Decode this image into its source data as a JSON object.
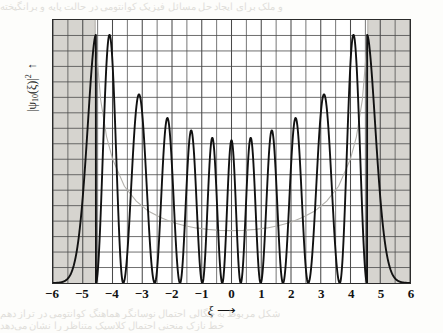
{
  "figure": {
    "name": "harmonic-oscillator-probability-density",
    "bleed_top": "و ملک برای ایجاد حل مسائل فیزیک کوانتومی در حالت پایه و برانگیخته",
    "bleed_bottom_1": "شکل مربوط به چگالی احتمال نوسانگر هماهنگ کوانتومی در تراز دهم",
    "bleed_bottom_2": "خط نازک منحنی احتمال کلاسیک متناظر را نشان می‌دهد"
  },
  "axes": {
    "xlabel": "ξ",
    "xlabel_arrow": "⟶",
    "ylabel_prefix": "|ψ",
    "ylabel_sub": "10",
    "ylabel_mid": "(ξ)|",
    "ylabel_sup": "2",
    "ylabel_arrow": "↑",
    "xticks": [
      "−6",
      "−5",
      "−4",
      "−3",
      "−2",
      "−1",
      "0",
      "1",
      "2",
      "3",
      "4",
      "5",
      "6"
    ]
  },
  "style": {
    "frame_color": "#2b2b2b",
    "grid_color": "#4a4a4a",
    "shade_color": "#d6d4cf",
    "curve_color": "#111111",
    "classical_color": "#b3b1ac",
    "paper_color": "#fdfdfb"
  },
  "chart_data": {
    "type": "line",
    "title": "",
    "xlabel": "ξ",
    "ylabel": "|ψ10(ξ)|²",
    "xlim": [
      -6,
      6
    ],
    "ylim": [
      0,
      1.06
    ],
    "grid": true,
    "grid_x_step": 0.5,
    "grid_y_divisions": 17,
    "legend": "none",
    "quantum_number_n": 10,
    "classical_turning_points": [
      -4.583,
      4.583
    ],
    "shaded_regions": [
      {
        "label": "classically-forbidden-left",
        "from": -6,
        "to": -4.583
      },
      {
        "label": "classically-forbidden-right",
        "from": 4.583,
        "to": 6
      }
    ],
    "series": [
      {
        "name": "|psi_10|^2 quantum probability density",
        "style": "solid-heavy",
        "peaks_x": [
          -4.1,
          -3.0,
          -2.1,
          -1.32,
          -0.62,
          0.0,
          0.62,
          1.32,
          2.1,
          3.0,
          4.1
        ],
        "peaks_y": [
          1.0,
          0.76,
          0.665,
          0.615,
          0.585,
          0.575,
          0.585,
          0.615,
          0.665,
          0.76,
          1.0
        ],
        "nodes_x": [
          -3.64,
          -2.58,
          -1.73,
          -0.98,
          -0.31,
          0.31,
          0.98,
          1.73,
          2.58,
          3.64
        ],
        "node_value": 0.0
      },
      {
        "name": "classical probability density",
        "style": "thin-faint",
        "x": [
          -4.58,
          -4.4,
          -4.2,
          -4.0,
          -3.6,
          -3.2,
          -2.8,
          -2.4,
          -2.0,
          -1.6,
          -1.2,
          -0.8,
          -0.4,
          0.0,
          0.4,
          0.8,
          1.2,
          1.6,
          2.0,
          2.4,
          2.8,
          3.2,
          3.6,
          4.0,
          4.2,
          4.4,
          4.58
        ],
        "y": [
          1.0,
          0.74,
          0.59,
          0.5,
          0.39,
          0.33,
          0.29,
          0.265,
          0.245,
          0.232,
          0.222,
          0.216,
          0.212,
          0.211,
          0.212,
          0.216,
          0.222,
          0.232,
          0.245,
          0.265,
          0.29,
          0.33,
          0.39,
          0.5,
          0.59,
          0.74,
          1.0
        ]
      }
    ]
  }
}
